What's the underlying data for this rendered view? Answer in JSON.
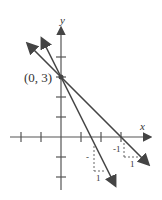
{
  "axes": {
    "x_label": "x",
    "y_label": "y"
  },
  "point": {
    "label": "(0, 3)",
    "x": 0,
    "y": 3
  },
  "lines": [
    {
      "name": "steep",
      "slope": -2,
      "intercept": 3,
      "rise_label": "-",
      "run_label": "1"
    },
    {
      "name": "shallow",
      "slope": -1,
      "intercept": 3,
      "rise_label": "-1",
      "run_label": "1"
    }
  ],
  "colors": {
    "line": "#444444"
  }
}
